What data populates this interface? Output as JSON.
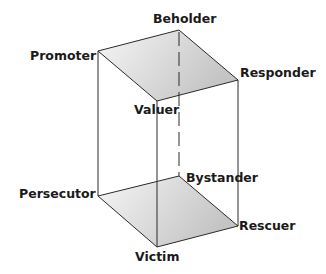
{
  "diagram": {
    "type": "3d-box",
    "top_face": {
      "vertices": [
        "Promoter",
        "Beholder",
        "Responder",
        "Valuer"
      ]
    },
    "bottom_face": {
      "vertices": [
        "Persecutor",
        "Bystander",
        "Rescuer",
        "Victim"
      ]
    },
    "labels": {
      "beholder": "Beholder",
      "promoter": "Promoter",
      "responder": "Responder",
      "valuer": "Valuer",
      "bystander": "Bystander",
      "persecutor": "Persecutor",
      "rescuer": "Rescuer",
      "victim": "Victim"
    },
    "hidden_edge": "Beholder-Bystander (dashed)",
    "colors": {
      "line": "#2a2a2a",
      "face_fill_light": "#f4f4f4",
      "face_fill_dark": "#c8c8c8"
    }
  }
}
